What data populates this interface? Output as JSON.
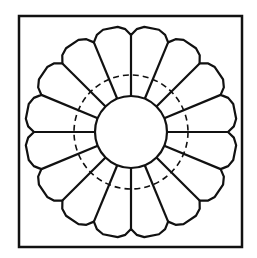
{
  "diagram": {
    "title": "",
    "type": "quilt-block-pattern",
    "pattern": "dresden-plate",
    "petal_count": 16,
    "colors": {
      "background": "#ffffff",
      "stroke": "#111111"
    },
    "frame": {
      "x": 19,
      "y": 16,
      "width": 223,
      "height": 231,
      "stroke_width": 2.5
    },
    "center": {
      "cx": 131,
      "cy": 132
    },
    "inner_circle": {
      "r": 36,
      "stroke_width": 2.2
    },
    "seam_allowance_circle": {
      "r": 57,
      "dash": "6 4",
      "stroke_width": 1.6
    },
    "petals": {
      "notch_r": 97,
      "shoulder_r": 103,
      "tip_r": 106,
      "stroke_width": 2.2
    }
  }
}
